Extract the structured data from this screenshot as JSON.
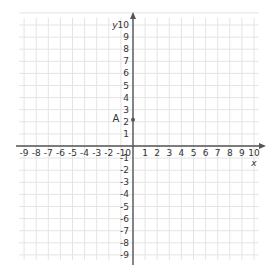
{
  "diagram": {
    "type": "coordinate-plane",
    "x_axis": {
      "label": "x",
      "min": -9,
      "max": 10,
      "ticks": [
        "-9",
        "-8",
        "-7",
        "-6",
        "-5",
        "-4",
        "-3",
        "-2",
        "-1",
        "0",
        "1",
        "2",
        "3",
        "4",
        "5",
        "6",
        "7",
        "8",
        "9",
        "10"
      ]
    },
    "y_axis": {
      "label": "y",
      "min": -9,
      "max": 10,
      "ticks": [
        "10",
        "9",
        "8",
        "7",
        "6",
        "5",
        "4",
        "3",
        "2",
        "1",
        "-1",
        "-2",
        "-3",
        "-4",
        "-5",
        "-6",
        "-7",
        "-8",
        "-9"
      ]
    },
    "points": [
      {
        "label": "A",
        "x": 0,
        "y": 2
      }
    ],
    "colors": {
      "grid": "#e4e4e4",
      "axis": "#555555",
      "text": "#333333"
    }
  }
}
